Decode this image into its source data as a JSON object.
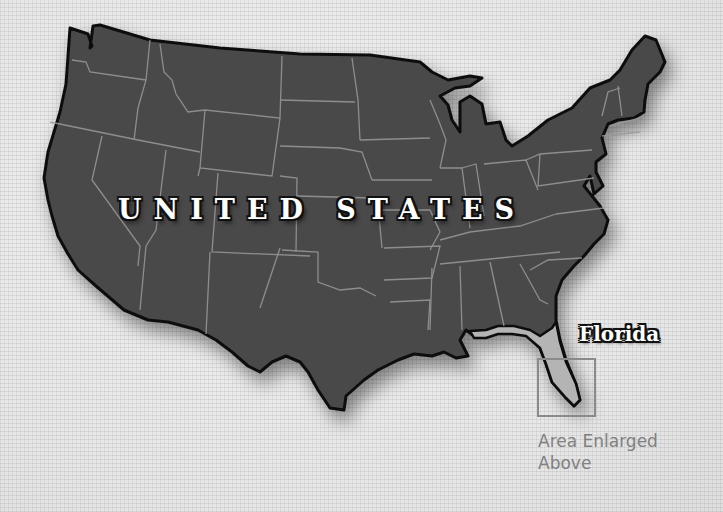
{
  "map": {
    "country_label": "UNITED STATES",
    "highlight_label": "Florida",
    "inset_note": "Area Enlarged Above",
    "colors": {
      "background": "#ececec",
      "land": "#4a4a4a",
      "border": "#0d0d0d",
      "state_lines": "#9a9a9a",
      "highlight_state": "#b4b4b4",
      "inset_box": "#8a8a8a",
      "label_text": "#ffffff",
      "note_text": "#808080"
    }
  }
}
